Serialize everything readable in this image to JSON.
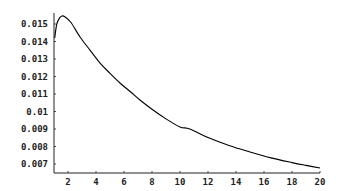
{
  "chart_data": {
    "type": "line",
    "title": "",
    "xlabel": "",
    "ylabel": "",
    "xlim": [
      1,
      20
    ],
    "ylim": [
      0.00637,
      0.0156
    ],
    "grid": false,
    "legend": null,
    "x_ticks": [
      2,
      4,
      6,
      8,
      10,
      12,
      14,
      16,
      18,
      20
    ],
    "x_tick_labels": [
      "2",
      "4",
      "6",
      "8",
      "10",
      "12",
      "14",
      "16",
      "18",
      "20"
    ],
    "y_ticks": [
      0.007,
      0.008,
      0.009,
      0.01,
      0.011,
      0.012,
      0.013,
      0.014,
      0.015
    ],
    "y_tick_labels": [
      "0.007",
      "0.008",
      "0.009",
      "0.01",
      "0.011",
      "0.012",
      "0.013",
      "0.014",
      "0.015"
    ],
    "series": [
      {
        "name": "curve",
        "color": "#000000",
        "x": [
          1.05,
          1.2,
          1.4,
          1.57,
          1.8,
          2.2,
          2.86,
          3.57,
          4.29,
          5.0,
          5.71,
          6.5,
          7.14,
          8.0,
          9.0,
          10.0,
          10.7,
          12.0,
          13.5,
          15.0,
          16.5,
          18.0,
          19.0,
          20.0
        ],
        "y": [
          0.0142,
          0.015,
          0.01535,
          0.01546,
          0.0154,
          0.0151,
          0.01426,
          0.01351,
          0.01277,
          0.01218,
          0.01163,
          0.0111,
          0.01066,
          0.01013,
          0.00958,
          0.00912,
          0.009,
          0.00851,
          0.00806,
          0.00769,
          0.00735,
          0.00708,
          0.00692,
          0.00677
        ]
      }
    ]
  }
}
